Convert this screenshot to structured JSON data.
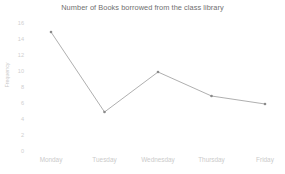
{
  "chart_data": {
    "type": "line",
    "title": "Number of Books borrowed from the class library",
    "xlabel": "",
    "ylabel": "Frequency",
    "categories": [
      "Monday",
      "Tuesday",
      "Wednesday",
      "Thursday",
      "Friday"
    ],
    "values": [
      15,
      5,
      10,
      7,
      6
    ],
    "series": [
      {
        "name": "Frequency",
        "values": [
          15,
          5,
          10,
          7,
          6
        ]
      }
    ],
    "ylim": [
      0,
      16
    ],
    "yticks": [
      0,
      2,
      4,
      6,
      8,
      10,
      12,
      14,
      16
    ],
    "ytick_labels": [
      "0",
      "2",
      "4",
      "6",
      "8",
      "10",
      "12",
      "14",
      "16"
    ],
    "grid": false,
    "legend": false,
    "legend_position": "none",
    "marker": "dot",
    "line_color": "#9a9a9a",
    "marker_color": "#8a8a8a",
    "title_color": "#6f6f6f",
    "tick_color": "#cbcbcb",
    "background_color": "#ffffff"
  }
}
